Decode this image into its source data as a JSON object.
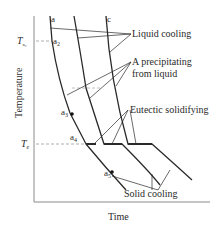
{
  "diagram": {
    "type": "cooling-curves",
    "axes": {
      "y_label": "Temperature",
      "x_label": "Time"
    },
    "temperature_marks": [
      {
        "symbol": "T",
        "subscript": "a₂",
        "id": "Ta2"
      },
      {
        "symbol": "T",
        "subscript": "e",
        "id": "Te"
      }
    ],
    "curve_labels": {
      "a": "a",
      "c": "c"
    },
    "points": {
      "a2": {
        "base": "a",
        "sub": "2"
      },
      "a3": {
        "base": "a",
        "sub": "3"
      },
      "a4": {
        "base": "a",
        "sub": "4"
      },
      "a5": {
        "base": "a",
        "sub": "5"
      }
    },
    "annotations": {
      "liquid_cooling": "Liquid cooling",
      "precipitating_1": "A precipitating",
      "precipitating_2": "from liquid",
      "eutectic": "Eutectic solidifying",
      "solid_cooling": "Solid cooling"
    },
    "colors": {
      "line": "#2a2a2a",
      "dashed": "#9a9a9a",
      "axis": "#8a8a8a"
    }
  }
}
